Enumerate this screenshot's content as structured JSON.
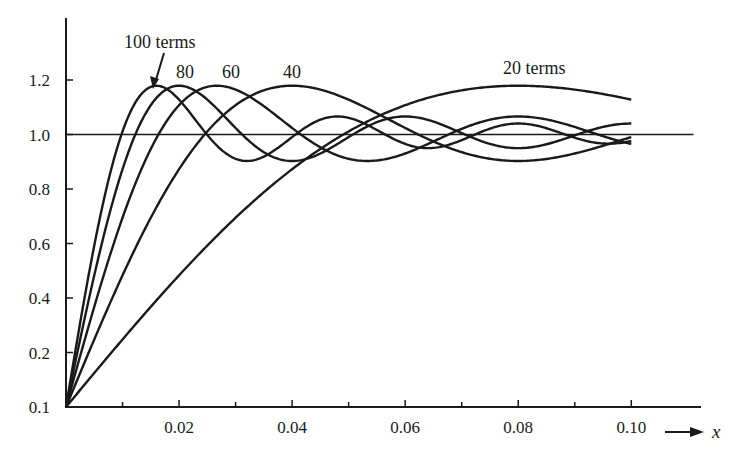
{
  "chart_data": {
    "type": "line",
    "title": "",
    "xlabel": "x",
    "ylabel": "",
    "xlim": [
      0,
      0.11
    ],
    "ylim": [
      0.0,
      1.38
    ],
    "grid": false,
    "legend": "inline labels",
    "x_ticks": [
      {
        "value": 0.01,
        "label": ""
      },
      {
        "value": 0.02,
        "label": "0.02"
      },
      {
        "value": 0.03,
        "label": ""
      },
      {
        "value": 0.04,
        "label": "0.04"
      },
      {
        "value": 0.05,
        "label": ""
      },
      {
        "value": 0.06,
        "label": "0.06"
      },
      {
        "value": 0.07,
        "label": ""
      },
      {
        "value": 0.08,
        "label": "0.08"
      },
      {
        "value": 0.09,
        "label": ""
      },
      {
        "value": 0.1,
        "label": "0.10"
      }
    ],
    "y_ticks": [
      {
        "value": 0.0,
        "label": "0.1"
      },
      {
        "value": 0.2,
        "label": "0.2"
      },
      {
        "value": 0.4,
        "label": "0.4"
      },
      {
        "value": 0.6,
        "label": "0.6"
      },
      {
        "value": 0.8,
        "label": "0.8"
      },
      {
        "value": 1.0,
        "label": "1.0"
      },
      {
        "value": 1.2,
        "label": "1.2"
      }
    ],
    "reference_line": {
      "y": 1.0,
      "x_end": 0.111
    },
    "x": [
      0,
      0.01,
      0.02,
      0.03,
      0.04,
      0.05,
      0.06,
      0.07,
      0.08,
      0.09,
      0.1
    ],
    "series": [
      {
        "name": "100 terms",
        "N": 100,
        "label": "100 terms",
        "values": [
          0,
          1.14,
          0.94,
          1.05,
          0.97,
          1.02,
          0.99,
          1.0,
          1.0,
          1.0,
          0.99
        ]
      },
      {
        "name": "80 terms",
        "N": 80,
        "label": "80",
        "values": [
          0,
          0.97,
          1.16,
          0.93,
          1.05,
          0.96,
          1.03,
          0.98,
          1.02,
          0.99,
          1.01
        ]
      },
      {
        "name": "60 terms",
        "N": 60,
        "label": "60",
        "values": [
          0,
          0.81,
          1.13,
          1.11,
          0.93,
          1.03,
          1.04,
          0.96,
          1.01,
          1.02,
          0.97
        ]
      },
      {
        "name": "40 terms",
        "N": 40,
        "label": "40",
        "values": [
          0,
          0.59,
          0.96,
          1.14,
          1.17,
          1.09,
          0.98,
          0.91,
          0.91,
          0.96,
          1.01
        ]
      },
      {
        "name": "20 terms",
        "N": 20,
        "label": "20 terms",
        "values": [
          0,
          0.25,
          0.49,
          0.7,
          0.87,
          1.0,
          1.08,
          1.13,
          1.18,
          1.17,
          1.12
        ]
      }
    ],
    "annotations": [
      {
        "text": "100 terms",
        "arrow_to": {
          "x": 0.0155,
          "y": 1.17
        }
      },
      {
        "text": "80"
      },
      {
        "text": "60"
      },
      {
        "text": "40"
      },
      {
        "text": "20 terms"
      }
    ],
    "model": "y = (2/pi) * Si(0.625 * pi * N * x)"
  },
  "labels": {
    "curve_100": "100 terms",
    "curve_80": "80",
    "curve_60": "60",
    "curve_40": "40",
    "curve_20": "20 terms",
    "x_axis_var": "x"
  }
}
